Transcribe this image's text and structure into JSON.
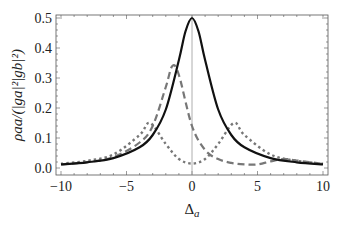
{
  "chart_data": {
    "type": "line",
    "title": "",
    "xlabel": "Δa",
    "xlabel_main": "Δ",
    "xlabel_sub": "a",
    "ylabel": "ρaa/(|ga|²|gb|²)",
    "xlim": [
      -10,
      10
    ],
    "ylim": [
      0,
      0.5
    ],
    "xticks": [
      -10,
      -5,
      0,
      5,
      10
    ],
    "xtick_labels": [
      "−10",
      "−5",
      "0",
      "5",
      "10"
    ],
    "yticks": [
      0.0,
      0.1,
      0.2,
      0.3,
      0.4,
      0.5
    ],
    "ytick_labels": [
      "0.0",
      "0.1",
      "0.2",
      "0.3",
      "0.4",
      "0.5"
    ],
    "grid": false,
    "vertical_reference_line_x": 0,
    "legend": null,
    "series": [
      {
        "name": "solid",
        "style": "solid",
        "color": "#111111",
        "x": [
          -10,
          -8,
          -6,
          -4,
          -3,
          -2,
          -1,
          -0.5,
          0,
          0.5,
          1,
          2,
          3,
          4,
          6,
          8,
          10
        ],
        "values": [
          0.012,
          0.019,
          0.033,
          0.069,
          0.11,
          0.195,
          0.36,
          0.455,
          0.5,
          0.455,
          0.36,
          0.195,
          0.11,
          0.069,
          0.033,
          0.019,
          0.012
        ]
      },
      {
        "name": "dashed",
        "style": "dashed",
        "color": "#777777",
        "x": [
          -10,
          -8,
          -6,
          -4,
          -3,
          -2,
          -1.5,
          -1,
          0,
          1,
          2,
          3,
          4,
          5,
          6,
          7,
          8,
          10
        ],
        "values": [
          0.012,
          0.02,
          0.036,
          0.085,
          0.14,
          0.27,
          0.34,
          0.31,
          0.14,
          0.06,
          0.03,
          0.017,
          0.012,
          0.012,
          0.022,
          0.03,
          0.025,
          0.014
        ]
      },
      {
        "name": "dotted",
        "style": "dotted",
        "color": "#777777",
        "x": [
          -10,
          -8,
          -6,
          -4,
          -3.2,
          -2,
          -1,
          0,
          1,
          2,
          3.2,
          4,
          6,
          8,
          10
        ],
        "values": [
          0.014,
          0.024,
          0.045,
          0.11,
          0.15,
          0.08,
          0.03,
          0.015,
          0.03,
          0.08,
          0.15,
          0.11,
          0.045,
          0.024,
          0.014
        ]
      }
    ]
  }
}
